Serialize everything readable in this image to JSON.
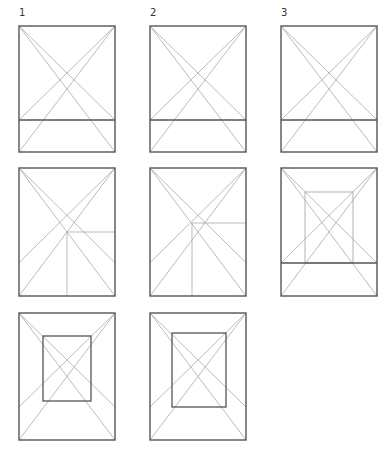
{
  "labels": [
    {
      "text": "1",
      "x": 19,
      "y": 8
    },
    {
      "text": "2",
      "x": 150,
      "y": 8
    },
    {
      "text": "3",
      "x": 281,
      "y": 8
    }
  ],
  "panels": [
    {
      "id": 1,
      "rect": [
        19,
        26,
        115,
        152
      ],
      "hline": 120,
      "type": "hline"
    },
    {
      "id": 2,
      "rect": [
        150,
        26,
        246,
        152
      ],
      "hline": 120,
      "type": "hline"
    },
    {
      "id": 3,
      "rect": [
        281,
        26,
        377,
        152
      ],
      "hline": 120,
      "type": "hline"
    },
    {
      "id": 4,
      "rect": [
        19,
        168,
        115,
        296
      ],
      "type": "corner",
      "cross": [
        67,
        232
      ]
    },
    {
      "id": 5,
      "rect": [
        150,
        168,
        246,
        296
      ],
      "type": "corner",
      "cross": [
        192,
        223
      ]
    },
    {
      "id": 6,
      "rect": [
        281,
        168,
        377,
        296
      ],
      "hline": 263,
      "inner": [
        305,
        192,
        353,
        263
      ],
      "type": "innerlight"
    },
    {
      "id": 7,
      "rect": [
        19,
        313,
        115,
        440
      ],
      "inner": [
        43,
        336,
        91,
        401
      ],
      "type": "inner"
    },
    {
      "id": 8,
      "rect": [
        150,
        313,
        246,
        440
      ],
      "inner": [
        172,
        333,
        226,
        407
      ],
      "type": "inner"
    }
  ]
}
